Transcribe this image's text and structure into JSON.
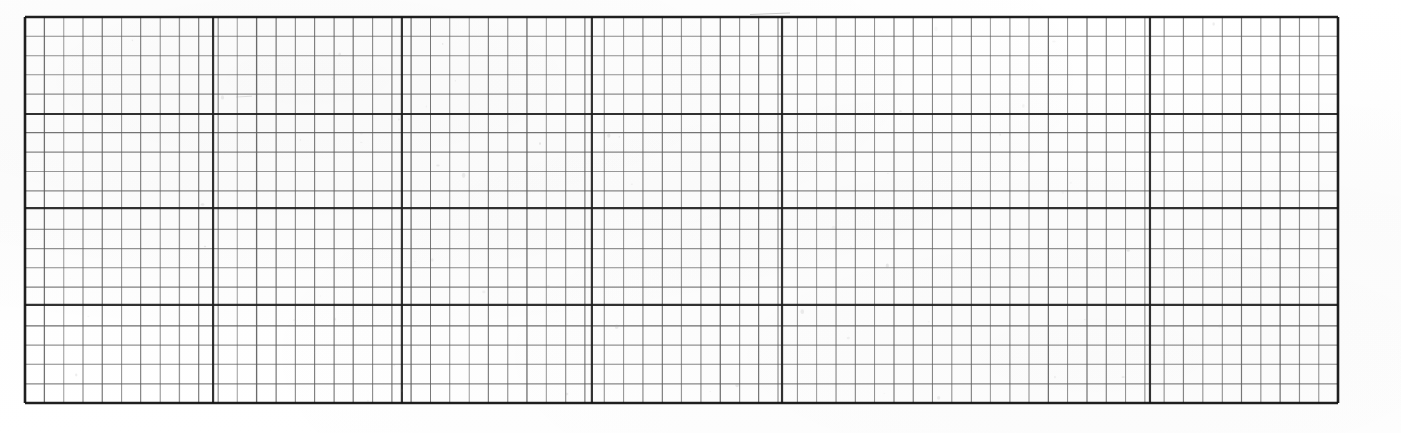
{
  "document": {
    "kind": "scanned-grid-paper",
    "description": "Scanned sheet of engineering / graph grid paper",
    "background_color": "#ffffff",
    "minor_line_color": "#5c5c5c",
    "major_line_color": "#1c1c1c",
    "border_color": "#141414"
  },
  "grid": {
    "origin_x": 25,
    "origin_y": 17,
    "width": 1313,
    "height": 386,
    "cell_width": 19.31,
    "cell_height": 19.3,
    "columns": 68,
    "rows": 20,
    "minor_line_width": 0.9,
    "major_line_width": 2.2,
    "border_line_width": 2.6,
    "major_vertical_x": [
      25,
      213,
      402,
      592,
      782,
      1150,
      1338
    ],
    "major_horizontal_y": [
      17,
      114,
      208,
      305,
      403
    ]
  },
  "chart_data": {
    "type": "table",
    "title": "",
    "xlabel": "",
    "ylabel": "",
    "categories": [],
    "values": [],
    "grid": true,
    "legend": "none"
  }
}
